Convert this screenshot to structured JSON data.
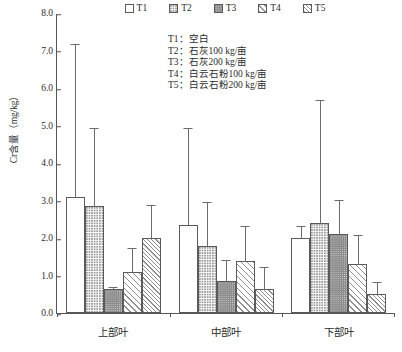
{
  "chart_data": {
    "type": "bar",
    "title": "",
    "xlabel": "",
    "ylabel": "Cr含量（mg/kg）",
    "ylim": [
      0,
      8
    ],
    "ytick_labels": [
      "0.0",
      "1.0",
      "2.0",
      "3.0",
      "4.0",
      "5.0",
      "6.0",
      "7.0",
      "8.0"
    ],
    "ytick_values": [
      0,
      1,
      2,
      3,
      4,
      5,
      6,
      7,
      8
    ],
    "categories": [
      "上部叶",
      "中部叶",
      "下部叶"
    ],
    "grid": false,
    "legend_position": "top-center",
    "series": [
      {
        "name": "T1",
        "fill": "t1",
        "values": [
          3.1,
          2.35,
          2.0
        ],
        "errors_upper": [
          7.2,
          4.95,
          2.35
        ]
      },
      {
        "name": "T2",
        "fill": "t2",
        "values": [
          2.85,
          1.8,
          2.4
        ],
        "errors_upper": [
          4.95,
          3.0,
          5.7
        ]
      },
      {
        "name": "T3",
        "fill": "t3",
        "values": [
          0.65,
          0.85,
          2.1
        ],
        "errors_upper": [
          0.72,
          1.45,
          3.05
        ]
      },
      {
        "name": "T4",
        "fill": "t4",
        "values": [
          1.1,
          1.4,
          1.3
        ],
        "errors_upper": [
          1.75,
          2.35,
          2.1
        ]
      },
      {
        "name": "T5",
        "fill": "t5",
        "values": [
          2.0,
          0.65,
          0.5
        ],
        "errors_upper": [
          2.9,
          1.25,
          0.85
        ]
      }
    ],
    "annotations": [
      "T1：空白",
      "T2：石灰100 kg/亩",
      "T3：石灰200 kg/亩",
      "T4：白云石粉100 kg/亩",
      "T5：白云石粉200 kg/亩"
    ]
  }
}
